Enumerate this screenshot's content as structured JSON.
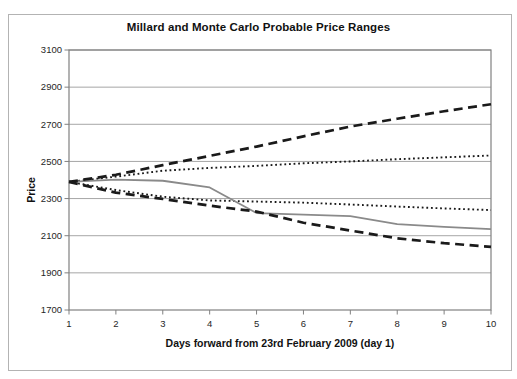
{
  "figure": {
    "title": "Millard and Monte Carlo Probable Price Ranges",
    "background_color": "#ffffff",
    "frame_border_color": "#b3b3b3"
  },
  "chart_data": {
    "type": "line",
    "title": "Millard and Monte Carlo Probable Price Ranges",
    "xlabel": "Days forward from 23rd February 2009 (day 1)",
    "ylabel": "Price",
    "x": [
      1,
      2,
      3,
      4,
      5,
      6,
      7,
      8,
      9,
      10
    ],
    "xticks": [
      1,
      2,
      3,
      4,
      5,
      6,
      7,
      8,
      9,
      10
    ],
    "xlim": [
      1,
      10
    ],
    "ylim": [
      1700,
      3100
    ],
    "yticks": [
      1700,
      1900,
      2100,
      2300,
      2500,
      2700,
      2900,
      3100
    ],
    "grid": "horizontal",
    "grid_color": "#a6a6a6",
    "plot_border_color": "#808080",
    "legend": "none",
    "series": [
      {
        "name": "upper-range-dotted",
        "style": "dotted",
        "color": "#1a1a1a",
        "values": [
          2390,
          2418,
          2450,
          2465,
          2476,
          2490,
          2500,
          2512,
          2522,
          2532
        ]
      },
      {
        "name": "lower-range-dotted",
        "style": "dotted",
        "color": "#1a1a1a",
        "values": [
          2390,
          2346,
          2310,
          2290,
          2284,
          2278,
          2268,
          2257,
          2247,
          2238
        ]
      },
      {
        "name": "central-price-solid",
        "style": "solid",
        "color": "#8a8a8a",
        "values": [
          2390,
          2402,
          2396,
          2360,
          2222,
          2214,
          2205,
          2162,
          2148,
          2136
        ]
      },
      {
        "name": "upper-range-dashed",
        "style": "dashed",
        "color": "#1a1a1a",
        "values": [
          2390,
          2428,
          2480,
          2530,
          2580,
          2635,
          2688,
          2730,
          2770,
          2808
        ]
      },
      {
        "name": "lower-range-dashed",
        "style": "dashed",
        "color": "#1a1a1a",
        "values": [
          2390,
          2332,
          2298,
          2262,
          2230,
          2170,
          2128,
          2086,
          2060,
          2040
        ]
      }
    ]
  }
}
